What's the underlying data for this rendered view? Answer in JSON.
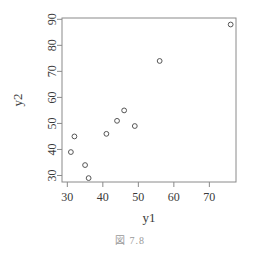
{
  "figure": {
    "caption": "図 7.8"
  },
  "chart_data": {
    "type": "scatter",
    "title": "",
    "xlabel": "y1",
    "ylabel": "y2",
    "xlim": [
      28.5,
      77.5
    ],
    "ylim": [
      27.5,
      90.5
    ],
    "xticks": [
      30,
      40,
      50,
      60,
      70
    ],
    "yticks": [
      30,
      40,
      50,
      60,
      70,
      80,
      90
    ],
    "xticklabels": [
      "30",
      "40",
      "50",
      "60",
      "70"
    ],
    "yticklabels": [
      "30",
      "40",
      "50",
      "60",
      "70",
      "80",
      "90"
    ],
    "grid": false,
    "legend": false,
    "marker": "open-circle",
    "marker_color": "#555555",
    "axis_color": "#8a8a8a",
    "box": true,
    "series": [
      {
        "name": "y2 vs y1",
        "x": [
          31,
          32,
          35,
          36,
          41,
          44,
          46,
          49,
          56,
          76
        ],
        "y": [
          39,
          45,
          34,
          29,
          46,
          51,
          55,
          49,
          74,
          88
        ]
      }
    ]
  }
}
